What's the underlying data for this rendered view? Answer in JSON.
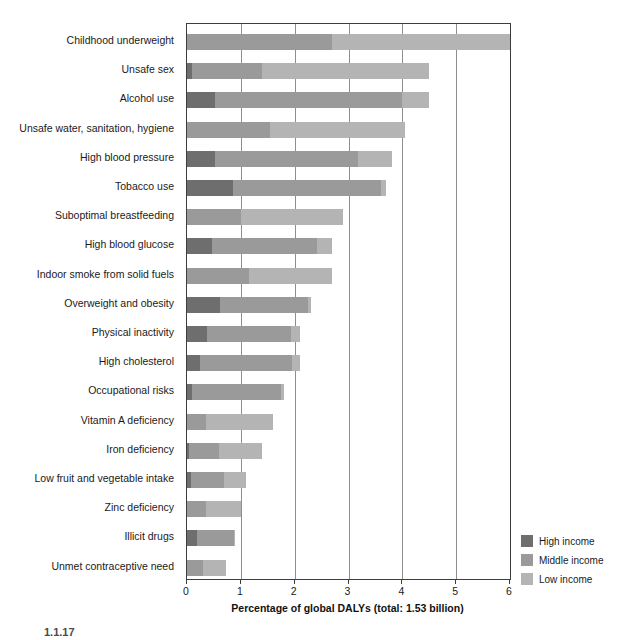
{
  "chart_data": {
    "type": "bar",
    "orientation": "horizontal",
    "stacked": true,
    "title": "",
    "xlabel": "Percentage of global DALYs (total: 1.53 billion)",
    "ylabel": "",
    "xlim": [
      0,
      6
    ],
    "xticks": [
      0,
      1,
      2,
      3,
      4,
      5,
      6
    ],
    "xtick_labels": [
      "0",
      "1",
      "2",
      "3",
      "4",
      "5",
      "6"
    ],
    "grid": true,
    "legend_position": "bottom-right",
    "categories": [
      "Childhood underweight",
      "Unsafe sex",
      "Alcohol use",
      "Unsafe water, sanitation, hygiene",
      "High blood pressure",
      "Tobacco use",
      "Suboptimal breastfeeding",
      "High blood glucose",
      "Indoor smoke from solid fuels",
      "Overweight and obesity",
      "Physical inactivity",
      "High cholesterol",
      "Occupational risks",
      "Vitamin A deficiency",
      "Iron deficiency",
      "Low fruit and vegetable intake",
      "Zinc deficiency",
      "Illicit drugs",
      "Unmet contraceptive need"
    ],
    "series": [
      {
        "name": "High income",
        "color": "#6e6e6e",
        "values": [
          0.0,
          0.09,
          0.52,
          0.0,
          0.52,
          0.85,
          0.0,
          0.47,
          0.0,
          0.62,
          0.38,
          0.25,
          0.1,
          0.0,
          0.04,
          0.08,
          0.0,
          0.18,
          0.0
        ]
      },
      {
        "name": "Middle income",
        "color": "#9a9a9a",
        "values": [
          2.7,
          1.3,
          3.48,
          1.55,
          2.65,
          2.75,
          1.0,
          1.95,
          1.15,
          1.63,
          1.55,
          1.7,
          1.65,
          0.35,
          0.56,
          0.6,
          0.35,
          0.7,
          0.3
        ]
      },
      {
        "name": "Low income",
        "color": "#b4b4b4",
        "values": [
          3.3,
          3.11,
          0.5,
          2.5,
          0.63,
          0.1,
          1.9,
          0.28,
          1.55,
          0.05,
          0.17,
          0.15,
          0.05,
          1.25,
          0.8,
          0.42,
          0.65,
          0.02,
          0.42
        ]
      }
    ],
    "totals": [
      6.0,
      4.5,
      4.5,
      4.05,
      3.8,
      3.7,
      2.9,
      2.7,
      2.7,
      2.3,
      2.1,
      2.1,
      1.8,
      1.6,
      1.4,
      1.1,
      1.0,
      0.9,
      0.72
    ],
    "legend": [
      {
        "label": "High income",
        "color": "#6e6e6e"
      },
      {
        "label": "Middle income",
        "color": "#9a9a9a"
      },
      {
        "label": "Low income",
        "color": "#b4b4b4"
      }
    ]
  },
  "caption": "1.1.17"
}
